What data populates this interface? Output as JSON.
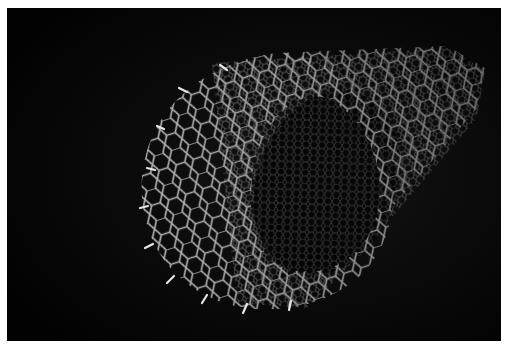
{
  "image": {
    "subject": "carbon-nanotube-render",
    "background_color": "#050505",
    "frame_color": "#ffffff",
    "lattice_color": "#d8d8d8",
    "highlight_color": "#ffffff"
  }
}
